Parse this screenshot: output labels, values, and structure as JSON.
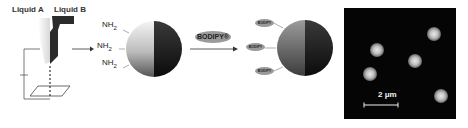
{
  "setup": {
    "liquid_a_label": "Liquid A",
    "liquid_b_label": "Liquid B"
  },
  "particle": {
    "groups": [
      "NH2",
      "NH2",
      "NH2"
    ],
    "group_base": "NH",
    "group_subscript": "2"
  },
  "reaction": {
    "reagent_label": "BODIPY®",
    "attached_labels": [
      "BODIPY",
      "BODIPY",
      "BODIPY"
    ]
  },
  "micrograph": {
    "scale_bar_label": "2 μm",
    "particle_count": 5
  }
}
